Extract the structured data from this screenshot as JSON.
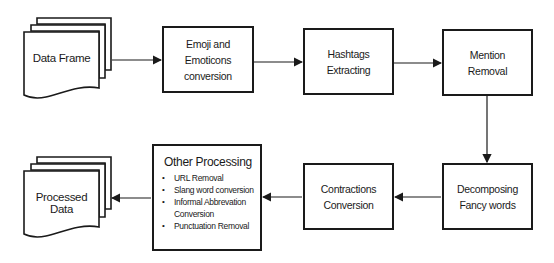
{
  "diagram": {
    "nodes": {
      "data_frame": "Data Frame",
      "emoji": "Emoji and Emoticons conversion",
      "hashtags": "Hashtags Extracting",
      "mention": "Mention Removal",
      "decomposing": "Decomposing Fancy words",
      "contractions": "Contractions Conversion",
      "other": {
        "title": "Other Processing",
        "items": [
          "URL Removal",
          "Slang word conversion",
          "Informal Abbrevation Conversion",
          "Punctuation Removal"
        ]
      },
      "processed": "Processed Data"
    },
    "edges": [
      [
        "data_frame",
        "emoji"
      ],
      [
        "emoji",
        "hashtags"
      ],
      [
        "hashtags",
        "mention"
      ],
      [
        "mention",
        "decomposing"
      ],
      [
        "decomposing",
        "contractions"
      ],
      [
        "contractions",
        "other"
      ],
      [
        "other",
        "processed"
      ]
    ]
  }
}
